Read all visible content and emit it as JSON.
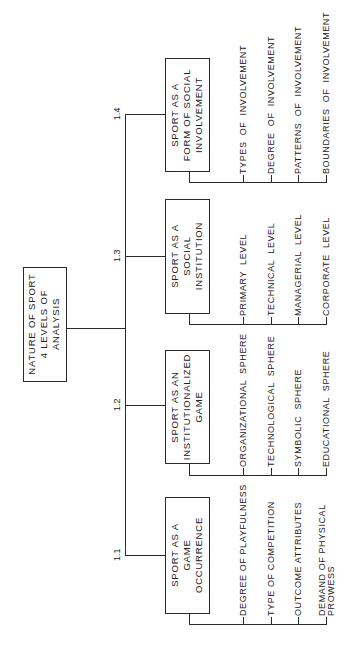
{
  "diagram": {
    "orientation": "rotated-90-ccw",
    "root": {
      "label_lines": [
        "NATURE OF SPORT",
        "4 LEVELS OF",
        "ANALYSIS"
      ]
    },
    "levels": [
      {
        "number": "1.1",
        "label_lines": [
          "SPORT  AS  A",
          "GAME",
          "OCCURRENCE"
        ],
        "items": [
          "DEGREE OF PLAYFULNESS",
          "TYPE OF COMPETITION",
          "OUTCOME ATTRIBUTES",
          "DEMAND OF PHYSICAL\nPROWESS"
        ]
      },
      {
        "number": "1.2",
        "label_lines": [
          "SPORT  AS  AN",
          "INSTITUTIONALIZED",
          "GAME"
        ],
        "items": [
          "ORGANIZATIONAL  SPHERE",
          "TECHNOLOGICAL  SPHERE",
          "SYMBOLIC  SPHERE",
          "EDUCATIONAL  SPHERE"
        ]
      },
      {
        "number": "1.3",
        "label_lines": [
          "SPORT  AS  A",
          "SOCIAL",
          "INSTITUTION"
        ],
        "items": [
          "PRIMARY  LEVEL",
          "TECHNICAL  LEVEL",
          "MANAGERIAL  LEVEL",
          "CORPORATE  LEVEL"
        ]
      },
      {
        "number": "1.4",
        "label_lines": [
          "SPORT  AS  A",
          "FORM  OF  SOCIAL",
          "INVOLVEMENT"
        ],
        "items": [
          "TYPES  OF  INVOLVEMENT",
          "DEGREE  OF  INVOLVEMENT",
          "PATTERNS  OF  INVOLVEMENT",
          "BOUNDARIES  OF  INVOLVEMENT"
        ]
      }
    ]
  }
}
